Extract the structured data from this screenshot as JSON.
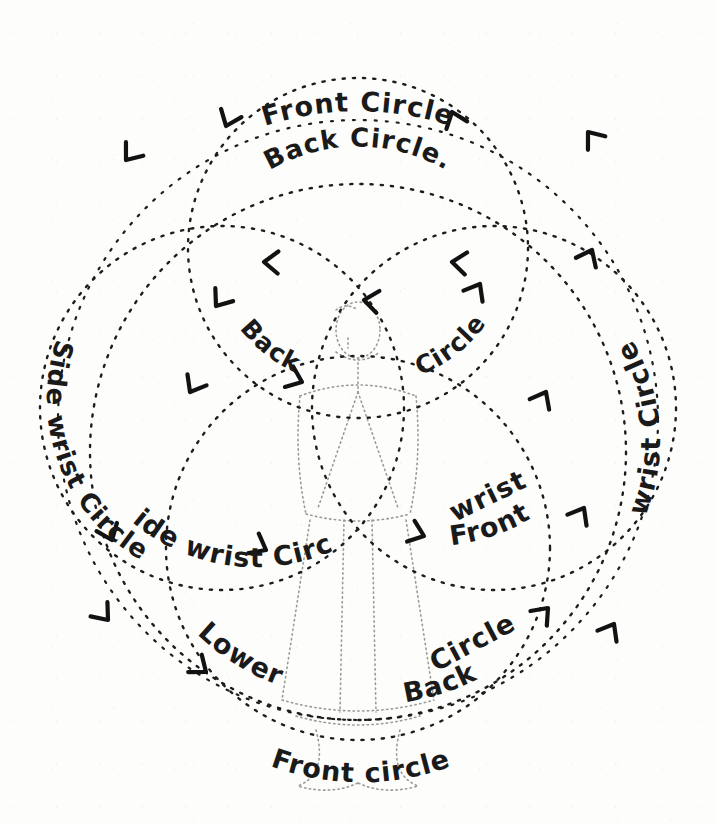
{
  "diagram": {
    "medium": "hand-drawn dotted-line illustration",
    "background_color": "#fdfdfc",
    "ink_color": "#1d1d1d",
    "figure_color": "#9a9a96"
  },
  "labels": {
    "top_outer": "Front Circle",
    "top_inner": "Back Circle.",
    "mid_left": "Back",
    "mid_right": "Circle",
    "left_outer": "Side wrist Circle",
    "right_outer": "wrist Circle",
    "right_inner_front": "Front",
    "right_inner_wrist": "wrist",
    "lower_left": "Lower",
    "lower_mid": "Back",
    "lower_right": "Circle",
    "bottom": "Front circle"
  },
  "label_list": [
    {
      "id": "front-circle-top",
      "text": "Front Circle",
      "position": "top outer arc"
    },
    {
      "id": "back-circle-top",
      "text": "Back Circle.",
      "position": "top inner arc"
    },
    {
      "id": "back-circle-middle",
      "text": "Back Circle",
      "position": "center, split around figure"
    },
    {
      "id": "side-wrist-circle",
      "text": "Side wrist Circle",
      "position": "left arc, reading downward"
    },
    {
      "id": "front-wrist-circle",
      "text": "Front wrist Circle",
      "position": "right arc, reading upward"
    },
    {
      "id": "lower-back-circle",
      "text": "Lower Back Circle",
      "position": "bottom arc"
    },
    {
      "id": "front-circle-bottom",
      "text": "Front circle",
      "position": "bottom outer arc"
    }
  ],
  "circles": [
    {
      "id": "outer-front-circle",
      "name": "Front Circle",
      "cx": 358,
      "cy": 420,
      "r": 300,
      "dash": "2 9"
    },
    {
      "id": "upper-back-circle",
      "name": "Back Circle",
      "cx": 358,
      "cy": 248,
      "r": 170,
      "dash": "2 9"
    },
    {
      "id": "left-side-wrist-circle",
      "name": "Side wrist Circle",
      "cx": 222,
      "cy": 408,
      "r": 182,
      "dash": "2 9"
    },
    {
      "id": "right-front-wrist-circle",
      "name": "Front wrist Circle",
      "cx": 494,
      "cy": 408,
      "r": 182,
      "dash": "2 9"
    },
    {
      "id": "lower-back-circle-path",
      "name": "Lower Back Circle",
      "cx": 358,
      "cy": 548,
      "r": 192,
      "dash": "2 9"
    },
    {
      "id": "bottom-front-circle",
      "name": "Front circle",
      "cx": 358,
      "cy": 452,
      "r": 268,
      "dash": "2 9"
    }
  ],
  "arrows": [
    {
      "id": "arrow-top-left-outer",
      "x": 126,
      "y": 160,
      "angle": 128,
      "on": "Front Circle"
    },
    {
      "id": "arrow-top-right-outer",
      "x": 588,
      "y": 132,
      "angle": 232,
      "on": "Front Circle"
    },
    {
      "id": "arrow-top-inner-right",
      "x": 452,
      "y": 112,
      "angle": 250,
      "on": "Back Circle"
    },
    {
      "id": "arrow-upper-left-inner",
      "x": 222,
      "y": 128,
      "angle": 110,
      "on": "Back Circle"
    },
    {
      "id": "arrow-mid-left",
      "x": 264,
      "y": 262,
      "angle": 182,
      "on": "Back Circle"
    },
    {
      "id": "arrow-mid-right",
      "x": 452,
      "y": 262,
      "angle": 186,
      "on": "Back Circle"
    },
    {
      "id": "arrow-center-top",
      "x": 358,
      "y": 300,
      "angle": 188,
      "on": "Back Circle"
    },
    {
      "id": "arrow-center-right-up",
      "x": 480,
      "y": 280,
      "angle": 300,
      "on": "Front wrist Circle"
    },
    {
      "id": "arrow-left-upper",
      "x": 214,
      "y": 304,
      "angle": 130,
      "on": "Back Circle"
    },
    {
      "id": "arrow-left-mid",
      "x": 188,
      "y": 392,
      "angle": 120,
      "on": "Side wrist Circle"
    },
    {
      "id": "arrow-center-back-left",
      "x": 300,
      "y": 380,
      "angle": 22,
      "on": "Back Circle"
    },
    {
      "id": "arrow-right-mid",
      "x": 546,
      "y": 392,
      "angle": 298,
      "on": "Front wrist Circle"
    },
    {
      "id": "arrow-right-upper",
      "x": 590,
      "y": 250,
      "angle": 296,
      "on": "wrist Circle"
    },
    {
      "id": "arrow-left-wrist",
      "x": 112,
      "y": 540,
      "angle": 68,
      "on": "Side wrist Circle"
    },
    {
      "id": "arrow-side-wrist-mid",
      "x": 264,
      "y": 548,
      "angle": 28,
      "on": "Side wrist Circle"
    },
    {
      "id": "arrow-front-left",
      "x": 424,
      "y": 536,
      "angle": 20,
      "on": "Front wrist Circle"
    },
    {
      "id": "arrow-lower-left",
      "x": 108,
      "y": 620,
      "angle": 50,
      "on": "Front circle"
    },
    {
      "id": "arrow-lower-left2",
      "x": 206,
      "y": 672,
      "angle": 38,
      "on": "Lower Back Circle"
    },
    {
      "id": "arrow-lower-right",
      "x": 548,
      "y": 608,
      "angle": 312,
      "on": "Lower Back Circle"
    },
    {
      "id": "arrow-lower-right2",
      "x": 612,
      "y": 624,
      "angle": 300,
      "on": "Front wrist Circle"
    },
    {
      "id": "arrow-right-low",
      "x": 584,
      "y": 508,
      "angle": 300,
      "on": "Front wrist Circle"
    }
  ],
  "figure": {
    "name": "central human figure"
  }
}
